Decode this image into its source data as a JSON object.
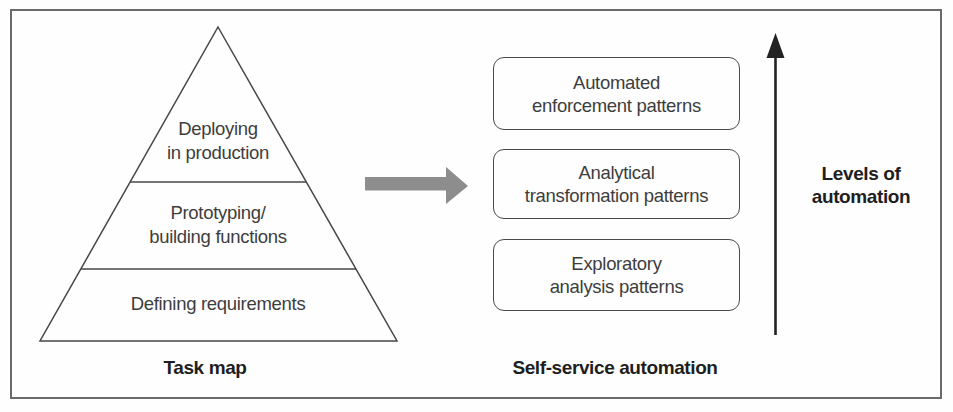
{
  "colors": {
    "line": "#474747",
    "text": "#3d3d3d",
    "bold_text": "#1e1e1e",
    "gray_arrow": "#8d8d8d",
    "frame_border": "#6a6a6a",
    "background": "#fefefe"
  },
  "task_map": {
    "caption": "Task map",
    "levels": [
      {
        "id": "deploying",
        "label": "Deploying\nin production"
      },
      {
        "id": "prototyping",
        "label": "Prototyping/\nbuilding functions"
      },
      {
        "id": "defining",
        "label": "Defining requirements"
      }
    ]
  },
  "self_service": {
    "caption": "Self-service automation",
    "boxes": [
      {
        "id": "automated-enforcement",
        "label": "Automated\nenforcement patterns"
      },
      {
        "id": "analytical-transformation",
        "label": "Analytical\ntransformation patterns"
      },
      {
        "id": "exploratory-analysis",
        "label": "Exploratory\nanalysis patterns"
      }
    ]
  },
  "axis": {
    "label": "Levels of\nautomation"
  }
}
